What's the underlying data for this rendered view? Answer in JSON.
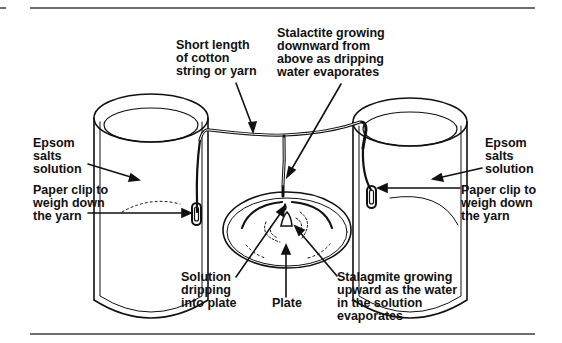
{
  "figure": {
    "title": "",
    "labels": {
      "string": "Short length\nof cotton\nstring or yarn",
      "stalactite": "Stalactite growing\ndownward from\nabove as dripping\nwater evaporates",
      "epsom_left": "Epsom\nsalts\nsolution",
      "paperclip_left": "Paper clip to\nweigh down\nthe yarn",
      "epsom_right": "Epsom\nsalts\nsolution",
      "paperclip_right": "Paper clip to\nweigh down\nthe yarn",
      "dripping": "Solution\ndripping\ninto plate",
      "plate": "Plate",
      "stalagmite": "Stalagmite growing\nupward as the water\nin the solution\nevaporates"
    },
    "colors": {
      "ink": "#111111",
      "rule": "#6e6e6e",
      "background": "#ffffff"
    }
  }
}
